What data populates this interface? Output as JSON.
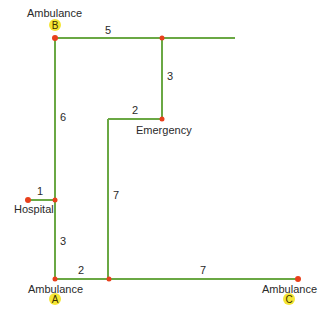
{
  "colors": {
    "edge": "#6aa844",
    "node": "#e8401c",
    "badge": "#f5e634",
    "text": "#2a2a2a"
  },
  "nodes": {
    "ambulance_b": {
      "label": "Ambulance",
      "badge": "B"
    },
    "ambulance_a": {
      "label": "Ambulance",
      "badge": "A"
    },
    "ambulance_c": {
      "label": "Ambulance",
      "badge": "C"
    },
    "hospital": {
      "label": "Hospital"
    },
    "emergency": {
      "label": "Emergency"
    }
  },
  "edges": {
    "b_top": "5",
    "top_to_emergency": "3",
    "emergency_left": "2",
    "b_down": "6",
    "middle_vertical": "7",
    "hospital_spur": "1",
    "hospital_to_a": "3",
    "a_right": "2",
    "bottom_to_c": "7"
  }
}
